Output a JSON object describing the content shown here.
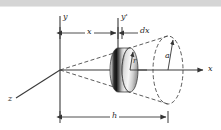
{
  "figure": {
    "background_color": "#ffffff",
    "top_band_color": "#d5d5d5",
    "line_color": "#3a3a3a",
    "dashed_color": "#555555",
    "labels": {
      "y_axis": "y",
      "y_prime_axis": "y'",
      "z_axis": "z",
      "x_axis": "x",
      "distance_x": "x",
      "thickness_dx": "dx",
      "disk_radius": "r",
      "base_radius": "a",
      "height_h": "h"
    },
    "geometry": {
      "apex": [
        60,
        70
      ],
      "x_axis_end": [
        205,
        70
      ],
      "y_axis_x": 60,
      "y_axis_top": 16,
      "y_axis_bottom": 118,
      "y_prime_axis_x": 118,
      "y_prime_axis_top": 18,
      "y_prime_axis_bottom": 62,
      "base_center": [
        168,
        70
      ],
      "base_radius_x": 15,
      "base_radius_y": 35,
      "disk_center": [
        124,
        70
      ],
      "disk_radius_x": 8,
      "disk_radius_y": 22,
      "dim_x_line_y": 33,
      "dim_dx_line_y": 33,
      "dim_h_line_y": 117
    }
  }
}
